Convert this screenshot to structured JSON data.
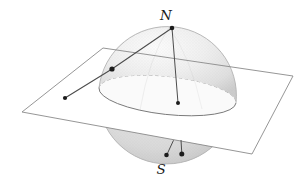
{
  "figure": {
    "description_labels": {
      "north_pole": "N",
      "south_pole": "S"
    },
    "colors": {
      "background": "#ffffff",
      "sphere_highlight": "#fbfbfb",
      "sphere_mid": "#ececec",
      "sphere_shadow": "#cccccc",
      "plane_fill": "#ffffff",
      "plane_edge": "#8a8a8a",
      "equator_front_edge": "#7a7a7a",
      "equator_back_edge_dashed": "#9a9a9a",
      "silhouette": "#b3b3b3",
      "projection_line": "#4d4d4d",
      "point_fill": "#1c1c1c",
      "label_color": "#1a1a1a",
      "equator_disk_fill": "#fafafa"
    }
  }
}
